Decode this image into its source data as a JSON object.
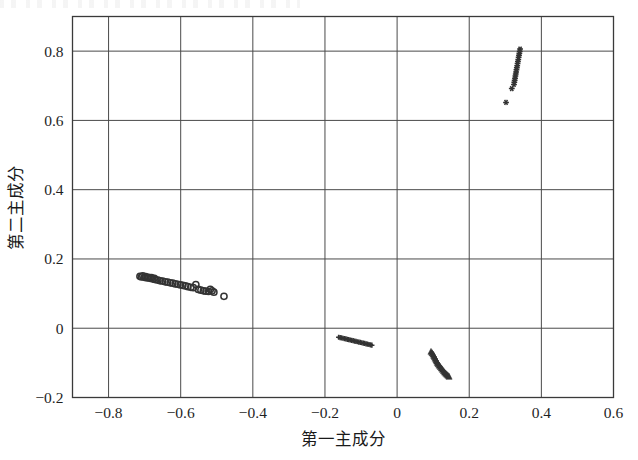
{
  "figure": {
    "kind": "scatter-plot",
    "background_color": "#ffffff",
    "frame_color": "#3a3a3a",
    "grid_color": "#4a4a4a",
    "marker_color": "#333333"
  },
  "chart_data": {
    "type": "scatter",
    "title": "",
    "xlabel": "第一主成分",
    "ylabel": "第二主成分",
    "xlim": [
      -0.9,
      0.6
    ],
    "ylim": [
      -0.2,
      0.9
    ],
    "xticks": [
      -0.8,
      -0.6,
      -0.4,
      -0.2,
      0,
      0.2,
      0.4,
      0.6
    ],
    "xticklabels": [
      "−0.8",
      "−0.6",
      "−0.4",
      "−0.2",
      "0",
      "0.2",
      "0.4",
      "0.6"
    ],
    "yticks": [
      -0.2,
      0,
      0.2,
      0.4,
      0.6,
      0.8
    ],
    "yticklabels": [
      "−0.2",
      "0",
      "0.2",
      "0.4",
      "0.6",
      "0.8"
    ],
    "grid": true,
    "legend": "none",
    "series": [
      {
        "name": "cluster-left",
        "marker": "circle-open",
        "color": "#333333",
        "points": [
          [
            -0.713,
            0.15
          ],
          [
            -0.709,
            0.148
          ],
          [
            -0.705,
            0.151
          ],
          [
            -0.701,
            0.147
          ],
          [
            -0.697,
            0.149
          ],
          [
            -0.693,
            0.145
          ],
          [
            -0.689,
            0.147
          ],
          [
            -0.685,
            0.144
          ],
          [
            -0.681,
            0.146
          ],
          [
            -0.677,
            0.142
          ],
          [
            -0.673,
            0.144
          ],
          [
            -0.669,
            0.14
          ],
          [
            -0.663,
            0.139
          ],
          [
            -0.657,
            0.137
          ],
          [
            -0.65,
            0.136
          ],
          [
            -0.643,
            0.134
          ],
          [
            -0.636,
            0.133
          ],
          [
            -0.629,
            0.131
          ],
          [
            -0.622,
            0.13
          ],
          [
            -0.615,
            0.128
          ],
          [
            -0.608,
            0.127
          ],
          [
            -0.601,
            0.125
          ],
          [
            -0.594,
            0.124
          ],
          [
            -0.587,
            0.122
          ],
          [
            -0.58,
            0.12
          ],
          [
            -0.572,
            0.118
          ],
          [
            -0.565,
            0.117
          ],
          [
            -0.558,
            0.126
          ],
          [
            -0.551,
            0.112
          ],
          [
            -0.544,
            0.11
          ],
          [
            -0.537,
            0.108
          ],
          [
            -0.53,
            0.107
          ],
          [
            -0.523,
            0.106
          ],
          [
            -0.518,
            0.112
          ],
          [
            -0.513,
            0.108
          ],
          [
            -0.508,
            0.104
          ],
          [
            -0.48,
            0.092
          ]
        ]
      },
      {
        "name": "cluster-middle",
        "marker": "plus",
        "color": "#333333",
        "points": [
          [
            -0.162,
            -0.026
          ],
          [
            -0.158,
            -0.027
          ],
          [
            -0.154,
            -0.028
          ],
          [
            -0.15,
            -0.029
          ],
          [
            -0.146,
            -0.03
          ],
          [
            -0.142,
            -0.031
          ],
          [
            -0.138,
            -0.032
          ],
          [
            -0.134,
            -0.033
          ],
          [
            -0.13,
            -0.034
          ],
          [
            -0.126,
            -0.035
          ],
          [
            -0.122,
            -0.036
          ],
          [
            -0.118,
            -0.037
          ],
          [
            -0.114,
            -0.038
          ],
          [
            -0.11,
            -0.039
          ],
          [
            -0.106,
            -0.04
          ],
          [
            -0.102,
            -0.041
          ],
          [
            -0.098,
            -0.042
          ],
          [
            -0.094,
            -0.043
          ],
          [
            -0.09,
            -0.044
          ],
          [
            -0.086,
            -0.045
          ],
          [
            -0.082,
            -0.046
          ],
          [
            -0.078,
            -0.047
          ],
          [
            -0.074,
            -0.048
          ],
          [
            -0.07,
            -0.049
          ]
        ]
      },
      {
        "name": "cluster-lower-right",
        "marker": "triangle",
        "color": "#333333",
        "points": [
          [
            0.094,
            -0.068
          ],
          [
            0.097,
            -0.072
          ],
          [
            0.1,
            -0.076
          ],
          [
            0.102,
            -0.08
          ],
          [
            0.104,
            -0.084
          ],
          [
            0.106,
            -0.088
          ],
          [
            0.108,
            -0.092
          ],
          [
            0.11,
            -0.096
          ],
          [
            0.112,
            -0.1
          ],
          [
            0.114,
            -0.104
          ],
          [
            0.117,
            -0.108
          ],
          [
            0.12,
            -0.112
          ],
          [
            0.123,
            -0.116
          ],
          [
            0.126,
            -0.12
          ],
          [
            0.129,
            -0.124
          ],
          [
            0.132,
            -0.128
          ],
          [
            0.135,
            -0.131
          ],
          [
            0.138,
            -0.134
          ],
          [
            0.141,
            -0.137
          ],
          [
            0.144,
            -0.14
          ]
        ]
      },
      {
        "name": "cluster-upper-right",
        "marker": "star",
        "color": "#333333",
        "points": [
          [
            0.341,
            0.806
          ],
          [
            0.34,
            0.8
          ],
          [
            0.339,
            0.794
          ],
          [
            0.338,
            0.788
          ],
          [
            0.337,
            0.782
          ],
          [
            0.336,
            0.776
          ],
          [
            0.335,
            0.77
          ],
          [
            0.334,
            0.764
          ],
          [
            0.333,
            0.758
          ],
          [
            0.332,
            0.752
          ],
          [
            0.331,
            0.746
          ],
          [
            0.33,
            0.74
          ],
          [
            0.329,
            0.734
          ],
          [
            0.328,
            0.728
          ],
          [
            0.327,
            0.722
          ],
          [
            0.326,
            0.716
          ],
          [
            0.325,
            0.71
          ],
          [
            0.324,
            0.704
          ],
          [
            0.318,
            0.692
          ],
          [
            0.302,
            0.652
          ]
        ]
      }
    ]
  }
}
